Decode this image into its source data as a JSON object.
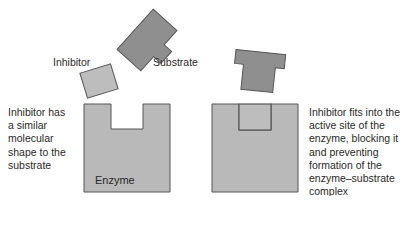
{
  "labels": {
    "inhibitor": "Inhibitor",
    "substrate": "Substrate",
    "enzyme": "Enzyme"
  },
  "descriptions": {
    "left": "Inhibitor has\na similar\nmolecular\nshape to the\nsubstrate",
    "right": "Inhibitor fits into the\nactive site of the\nenzyme, blocking it\nand preventing\nformation of the\nenzyme–substrate\ncomplex"
  },
  "colors": {
    "enzyme_fill": "#b9b9b9",
    "inhibitor_fill": "#bdbdbd",
    "substrate_fill": "#8f8f8f",
    "stroke": "#555555"
  }
}
